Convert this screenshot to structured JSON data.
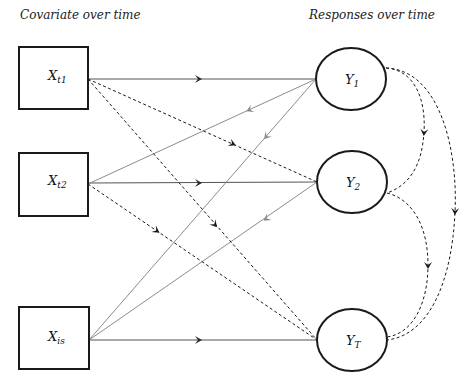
{
  "headings": {
    "left": "Covariate over time",
    "right": "Responses over time"
  },
  "covariates": [
    {
      "id": "X_t1",
      "base": "X",
      "sub": "t1"
    },
    {
      "id": "X_t2",
      "base": "X",
      "sub": "t2"
    },
    {
      "id": "X_is",
      "base": "X",
      "sub": "is"
    }
  ],
  "responses": [
    {
      "id": "Y_1",
      "base": "Y",
      "sub": "1"
    },
    {
      "id": "Y_2",
      "base": "Y",
      "sub": "2"
    },
    {
      "id": "Y_T",
      "base": "Y",
      "sub": "T"
    }
  ],
  "edges": {
    "solid_forward": [
      {
        "from": "X_t1",
        "to": "Y_1"
      },
      {
        "from": "X_t2",
        "to": "Y_2"
      },
      {
        "from": "X_is",
        "to": "Y_T"
      }
    ],
    "solid_feedback": [
      {
        "from": "Y_1",
        "to": "X_t2"
      },
      {
        "from": "Y_1",
        "to": "X_is"
      },
      {
        "from": "Y_2",
        "to": "X_is"
      }
    ],
    "dashed_lagged": [
      {
        "from": "X_t1",
        "to": "Y_2"
      },
      {
        "from": "X_t1",
        "to": "Y_T"
      },
      {
        "from": "X_t2",
        "to": "Y_T"
      }
    ],
    "dashed_response_curves": [
      {
        "from": "Y_1",
        "to": "Y_2"
      },
      {
        "from": "Y_1",
        "to": "Y_T"
      },
      {
        "from": "Y_2",
        "to": "Y_T"
      }
    ]
  },
  "colors": {
    "node_stroke": "#1a1a1a",
    "forward_line": "#555555",
    "feedback_line": "#888888",
    "dashed_line": "#1a1a1a",
    "feedback_arrow": "#8a8a8a",
    "forward_arrow": "#2a2a2a"
  }
}
